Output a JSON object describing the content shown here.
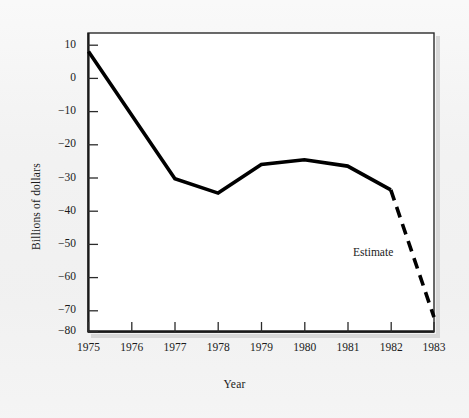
{
  "chart_data": {
    "type": "line",
    "title": "",
    "xlabel": "Year",
    "ylabel": "Billions of dollars",
    "x": [
      1975,
      1976,
      1977,
      1978,
      1979,
      1980,
      1981,
      1982,
      1983
    ],
    "xlim": [
      1975,
      1983
    ],
    "ylim": [
      -80,
      10
    ],
    "yticks": [
      10,
      0,
      -10,
      -20,
      -30,
      -40,
      -50,
      -60,
      -70,
      -80
    ],
    "ytick_labels": [
      "10",
      "0",
      "−10",
      "−20",
      "−30",
      "−40",
      "−50",
      "−60",
      "−70",
      "−80"
    ],
    "xticks": [
      1975,
      1976,
      1977,
      1978,
      1979,
      1980,
      1981,
      1982,
      1983
    ],
    "xtick_labels": [
      "1975",
      "1976",
      "1977",
      "1978",
      "1979",
      "1980",
      "1981",
      "1982",
      "1983"
    ],
    "grid": false,
    "legend": false,
    "series": [
      {
        "name": "Federal budget deficit (actual)",
        "style": "solid",
        "color": "#000000",
        "x": [
          1975,
          1977,
          1978,
          1979,
          1980,
          1981,
          1982
        ],
        "values": [
          8,
          -32,
          -36.5,
          -27.5,
          -26,
          -28,
          -35.5
        ]
      },
      {
        "name": "Federal budget deficit (estimate)",
        "style": "dashed",
        "color": "#000000",
        "x": [
          1982,
          1983
        ],
        "values": [
          -35.5,
          -75.5
        ]
      }
    ],
    "annotations": [
      {
        "text": "Estimate",
        "x": 1982.0,
        "y": -57
      }
    ]
  },
  "figure": {
    "background_color": "#f2f2f2",
    "plot_background_color": "#ffffff",
    "axis_color": "#2b2b2b",
    "line_color": "#000000"
  }
}
